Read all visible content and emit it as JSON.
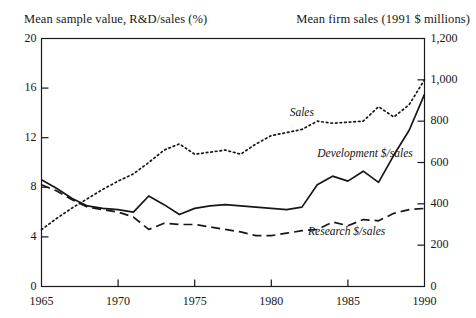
{
  "chart_data": {
    "type": "line",
    "title": "",
    "xlabel": "",
    "ylabel": "Mean sample value, R&D/sales (%)",
    "y2label": "Mean firm sales (1991 $ millions)",
    "xlim": [
      1965,
      1990
    ],
    "ylim": [
      0,
      20
    ],
    "y2lim": [
      0,
      1200
    ],
    "grid": false,
    "legend_position": "inline-annotations",
    "xticks": [
      1965,
      1970,
      1975,
      1980,
      1985,
      1990
    ],
    "xtick_labels": [
      "1965",
      "1970",
      "1975",
      "1980",
      "1985",
      "1990"
    ],
    "yticks": [
      0,
      4,
      8,
      12,
      16,
      20
    ],
    "ytick_labels": [
      "0",
      "4",
      "8",
      "12",
      "16",
      "20"
    ],
    "y2ticks": [
      0,
      200,
      400,
      600,
      800,
      1000,
      1200
    ],
    "y2tick_labels": [
      "0",
      "200",
      "400",
      "600",
      "800",
      "1,000",
      "1,200"
    ],
    "x": [
      1965,
      1966,
      1967,
      1968,
      1969,
      1970,
      1971,
      1972,
      1973,
      1974,
      1975,
      1976,
      1977,
      1978,
      1979,
      1980,
      1981,
      1982,
      1983,
      1984,
      1985,
      1986,
      1987,
      1988,
      1989,
      1990
    ],
    "series": [
      {
        "name": "Sales",
        "axis": "right",
        "style": "dotted",
        "units": "1991 $ millions",
        "values": [
          275,
          330,
          380,
          425,
          470,
          510,
          545,
          600,
          660,
          690,
          640,
          650,
          660,
          640,
          690,
          730,
          745,
          760,
          800,
          790,
          795,
          800,
          870,
          820,
          880,
          1000
        ]
      },
      {
        "name": "Development $/sales",
        "axis": "left",
        "style": "solid",
        "units": "%",
        "values": [
          8.6,
          7.9,
          7.1,
          6.5,
          6.3,
          6.2,
          6.0,
          7.3,
          6.6,
          5.8,
          6.3,
          6.5,
          6.6,
          6.5,
          6.4,
          6.3,
          6.2,
          6.4,
          8.2,
          8.9,
          8.5,
          9.3,
          8.4,
          10.6,
          12.6,
          15.5
        ]
      },
      {
        "name": "Research $/sales",
        "axis": "left",
        "style": "dashed",
        "units": "%",
        "values": [
          8.2,
          7.7,
          7.0,
          6.4,
          6.2,
          6.0,
          5.6,
          4.6,
          5.1,
          5.0,
          5.0,
          4.8,
          4.6,
          4.4,
          4.1,
          4.1,
          4.3,
          4.5,
          4.6,
          5.2,
          4.9,
          5.4,
          5.3,
          5.9,
          6.2,
          6.3
        ]
      }
    ],
    "annotations": [
      {
        "text": "Sales",
        "x": 1981.2,
        "y_percent": 13.9
      },
      {
        "text": "Development $/sales",
        "x": 1983.0,
        "y_percent": 10.6
      },
      {
        "text": "Research $/sales",
        "x": 1982.4,
        "y_percent": 4.35
      }
    ]
  },
  "colors": {
    "ink": "#171717",
    "frame": "#1a1a1a",
    "background": "#ffffff"
  }
}
